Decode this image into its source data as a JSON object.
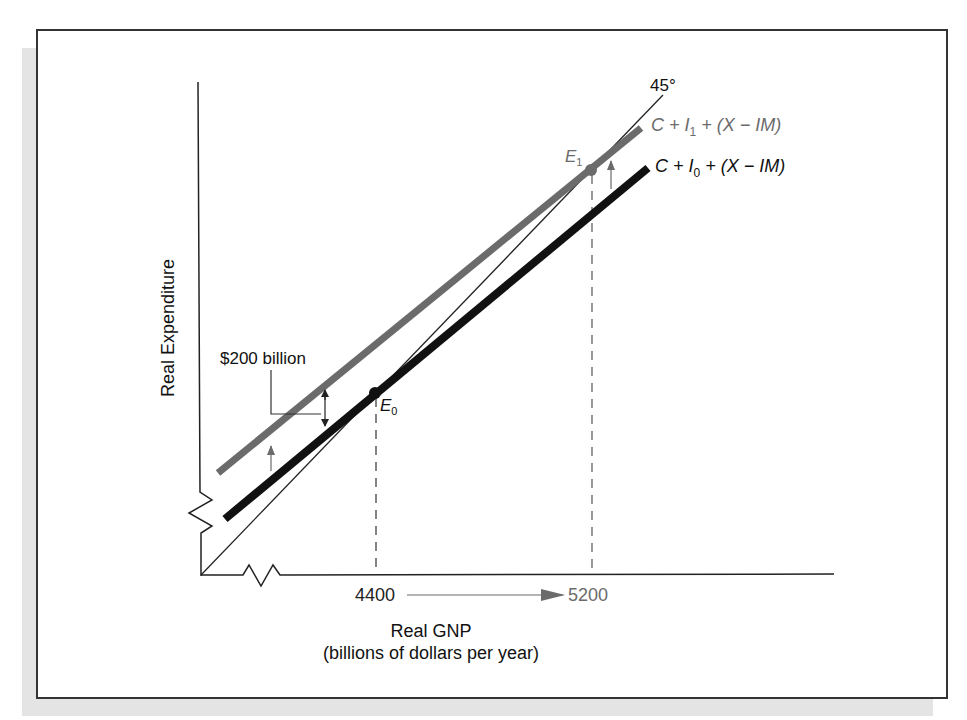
{
  "diagram": {
    "type": "aggregate-expenditure-45-degree-diagram",
    "y_axis_label": "Real Expenditure",
    "x_axis_label": "Real GNP",
    "x_axis_sublabel": "(billions of dollars per year)",
    "x_ticks": [
      {
        "label": "4400",
        "value": 4400,
        "color": "#222222"
      },
      {
        "label": "5200",
        "value": 5200,
        "color": "#6b6b6b"
      }
    ],
    "reference_line": {
      "label": "45°"
    },
    "curves": [
      {
        "id": "ae1",
        "label_main": "C + I",
        "label_sub": "1",
        "label_tail": " + (X − IM)",
        "color": "#6b6b6b"
      },
      {
        "id": "ae0",
        "label_main": "C + I",
        "label_sub": "0",
        "label_tail": " + (X − IM)",
        "color": "#111111"
      }
    ],
    "equilibria": [
      {
        "id": "E0",
        "label": "E",
        "sub": "0",
        "x_value": 4400,
        "color": "#111111"
      },
      {
        "id": "E1",
        "label": "E",
        "sub": "1",
        "x_value": 5200,
        "color": "#6b6b6b"
      }
    ],
    "annotation": {
      "shift_label": "$200 billion"
    },
    "colors": {
      "frame": "#333333",
      "shadow": "#e4e4e4",
      "shifted_curve": "#6b6b6b",
      "original_curve": "#111111"
    }
  }
}
